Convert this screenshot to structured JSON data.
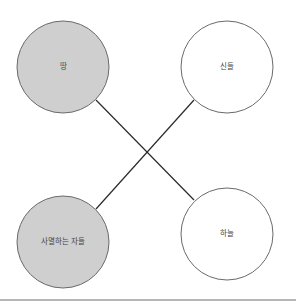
{
  "diagram": {
    "title": "",
    "nodes": [
      {
        "id": "earth",
        "label": "땅",
        "cx": 63,
        "cy": 67,
        "r": 46,
        "fill": "#cfcfcf",
        "stroke": "#6a6a6a"
      },
      {
        "id": "gods",
        "label": "신들",
        "cx": 227,
        "cy": 67,
        "r": 46,
        "fill": "#ffffff",
        "stroke": "#6a6a6a"
      },
      {
        "id": "mortals",
        "label": "사멸하는 자들",
        "cx": 63,
        "cy": 242,
        "r": 46,
        "fill": "#cfcfcf",
        "stroke": "#6a6a6a"
      },
      {
        "id": "sky",
        "label": "하늘",
        "cx": 227,
        "cy": 234,
        "r": 46,
        "fill": "#ffffff",
        "stroke": "#6a6a6a"
      }
    ],
    "edges": [
      {
        "from": "earth",
        "to": "sky",
        "x1": 96,
        "y1": 100,
        "x2": 194,
        "y2": 200
      },
      {
        "from": "gods",
        "to": "mortals",
        "x1": 194,
        "y1": 100,
        "x2": 96,
        "y2": 209
      }
    ],
    "colors": {
      "edge": "#2a2a2a",
      "bottom_rule": "#b5b5b5"
    },
    "bottom_rule_y": 300
  }
}
